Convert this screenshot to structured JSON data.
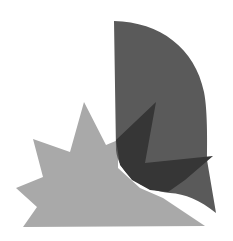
{
  "artwork": {
    "background": "#ffffff",
    "shapes": {
      "star_burst": {
        "fill": "#a9a9a9",
        "points": "84,102 106,145 118,140 118,168 140,188 163,198 205,226 23,227 37,207 16,188 43,177 33,139 70,152"
      },
      "leaf_flag": {
        "fill": "#5a5a5a",
        "path": "M114,21 C160,22 195,48 204,92 C208,112 207,150 207,160 L216,213 C200,200 185,194 170,193 C140,190 118,172 116,150 L114,21 Z"
      },
      "overlap_triangle": {
        "fill": "#363636",
        "points": "156,102 145,163 213,156 185,180 168,192 150,190 132,180 120,165 116,140"
      }
    }
  }
}
